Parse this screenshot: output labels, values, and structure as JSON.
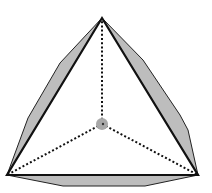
{
  "diagram": {
    "type": "tetrahedron-projection",
    "colors": {
      "background": "#ffffff",
      "edge": "#111111",
      "bulge_fill": "#bdbdbd",
      "dotted": "#111111",
      "center_fill": "#a8a8a8"
    },
    "vertices": {
      "top": [
        102,
        18
      ],
      "bottom_left": [
        7,
        175
      ],
      "bottom_right": [
        198,
        175
      ],
      "center": [
        102,
        124
      ]
    },
    "bulges": {
      "left": [
        [
          102,
          18
        ],
        [
          60,
          63
        ],
        [
          28,
          118
        ],
        [
          7,
          175
        ]
      ],
      "right": [
        [
          102,
          18
        ],
        [
          143,
          60
        ],
        [
          180,
          115
        ],
        [
          188,
          130
        ],
        [
          198,
          175
        ]
      ],
      "bottom": [
        [
          7,
          175
        ],
        [
          63,
          186
        ],
        [
          145,
          186
        ],
        [
          198,
          175
        ]
      ]
    },
    "center_marker_radius": 6
  }
}
